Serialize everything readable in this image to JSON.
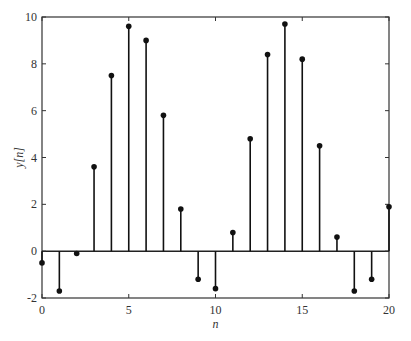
{
  "chart_data": {
    "type": "stem",
    "title": "",
    "xlabel": "n",
    "ylabel": "y[n]",
    "xlim": [
      0,
      20
    ],
    "ylim": [
      -2,
      10
    ],
    "grid": false,
    "legend": null,
    "xticks": [
      0,
      5,
      10,
      15,
      20
    ],
    "yticks": [
      -2,
      0,
      2,
      4,
      6,
      8,
      10
    ],
    "x": [
      0,
      1,
      2,
      3,
      4,
      5,
      6,
      7,
      8,
      9,
      10,
      11,
      12,
      13,
      14,
      15,
      16,
      17,
      18,
      19,
      20
    ],
    "values": [
      -0.5,
      -1.7,
      -0.1,
      3.6,
      7.5,
      9.6,
      9.0,
      5.8,
      1.8,
      -1.2,
      -1.6,
      0.8,
      4.8,
      8.4,
      9.7,
      8.2,
      4.5,
      0.6,
      -1.7,
      -1.2,
      1.9
    ],
    "baseline": 0
  }
}
